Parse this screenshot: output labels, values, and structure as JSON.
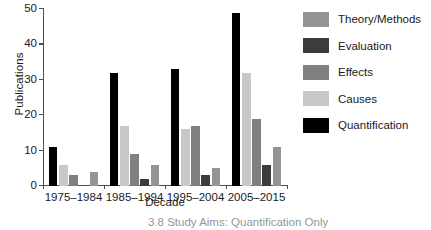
{
  "chart_data": {
    "type": "bar",
    "title": "",
    "xlabel": "Decade",
    "ylabel": "Publications",
    "ylim": [
      0,
      50
    ],
    "yticks": [
      0,
      10,
      20,
      30,
      40,
      50
    ],
    "grid": false,
    "legend_position": "right",
    "categories": [
      "1975–1984",
      "1985–1994",
      "1995–2004",
      "2005–2015"
    ],
    "series": [
      {
        "name": "Quantification",
        "color": "#000000",
        "values": [
          11,
          32,
          33,
          49
        ]
      },
      {
        "name": "Causes",
        "color": "#c8c8c8",
        "values": [
          6,
          17,
          16,
          32
        ]
      },
      {
        "name": "Effects",
        "color": "#808080",
        "values": [
          3,
          9,
          17,
          19
        ]
      },
      {
        "name": "Evaluation",
        "color": "#3c3c3c",
        "values": [
          0,
          2,
          3,
          6
        ]
      },
      {
        "name": "Theory/Methods",
        "color": "#949494",
        "values": [
          4,
          6,
          5,
          11
        ]
      }
    ]
  },
  "legend": {
    "items": [
      {
        "label": "Theory/Methods",
        "color": "#949494"
      },
      {
        "label": "Evaluation",
        "color": "#3c3c3c"
      },
      {
        "label": "Effects",
        "color": "#808080"
      },
      {
        "label": "Causes",
        "color": "#c8c8c8"
      },
      {
        "label": "Quantification",
        "color": "#000000"
      }
    ]
  },
  "caption": {
    "text": "3.8  Study Aims: Quantification Only"
  }
}
